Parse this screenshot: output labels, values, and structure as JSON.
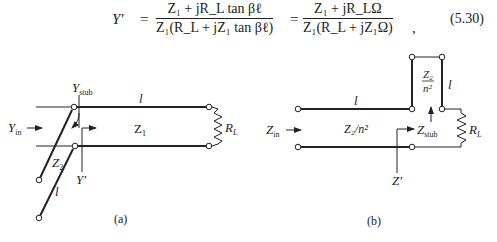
{
  "equation": {
    "lhs": "Y′",
    "eq1": "=",
    "frac1_num": "Z₁ + jR_L tan βℓ",
    "frac1_den": "Z₁(R_L + jZ₁ tan βℓ)",
    "eq2": "=",
    "frac2_num": "Z₁ + jR_LΩ",
    "frac2_den": "Z₁(R_L + jZ₁Ω)",
    "comma": ",",
    "number": "(5.30)"
  },
  "figure_a": {
    "caption": "(a)",
    "labels": {
      "y_stub": "Y",
      "y_stub_sub": "stub",
      "line_length": "l",
      "y_in": "Y",
      "y_in_sub": "in",
      "z1": "Z",
      "z1_sub": "1",
      "load": "R",
      "load_sub": "L",
      "z2": "Z",
      "z2_sub": "2",
      "y_prime": "Y′",
      "stub_length": "l"
    }
  },
  "figure_b": {
    "caption": "(b)",
    "labels": {
      "line_length": "l",
      "z_in": "Z",
      "z_in_sub": "in",
      "line_impedance": "Z₂/n²",
      "z_stub": "Z",
      "z_stub_sub": "stub",
      "stub_impedance_num": "Z₂",
      "stub_impedance_den": "n²",
      "stub_length": "l",
      "load": "R",
      "load_sub": "L",
      "z_prime": "Z′"
    }
  }
}
